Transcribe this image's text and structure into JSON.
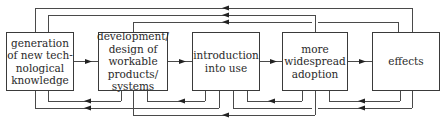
{
  "diagram": {
    "stages": [
      {
        "id": "generation",
        "label": "generation\nof new tech-\nnological\nknowledge",
        "x": 6,
        "y": 32,
        "w": 68,
        "h": 59
      },
      {
        "id": "development",
        "label": "development/\ndesign of\nworkable\nproducts/\nsystems",
        "x": 98,
        "y": 32,
        "w": 70,
        "h": 59
      },
      {
        "id": "introduction",
        "label": "introduction\ninto use",
        "x": 192,
        "y": 32,
        "w": 68,
        "h": 59
      },
      {
        "id": "adoption",
        "label": "more\nwidespread\nadoption",
        "x": 282,
        "y": 32,
        "w": 66,
        "h": 59
      },
      {
        "id": "effects",
        "label": "effects",
        "x": 372,
        "y": 32,
        "w": 68,
        "h": 59
      }
    ],
    "forward_arrows": [
      {
        "from": "generation",
        "to": "development"
      },
      {
        "from": "development",
        "to": "introduction"
      },
      {
        "from": "introduction",
        "to": "adoption"
      },
      {
        "from": "adoption",
        "to": "effects"
      }
    ],
    "feedback_top": [
      {
        "from": "effects",
        "to": "generation",
        "y": 8,
        "from_x": 412,
        "to_x": 35,
        "arrow_x": 226
      },
      {
        "from": "adoption",
        "to": "generation",
        "y": 15,
        "from_x": 315,
        "to_x": 48,
        "arrow_x": 226
      },
      {
        "from": "effects",
        "to": "development",
        "y": 22,
        "from_x": 398,
        "to_x": 133,
        "arrow_x": 226,
        "gap_x": 315
      }
    ],
    "feedback_bottom": [
      {
        "from": "development",
        "to": "generation",
        "y": 101,
        "from_x": 121,
        "to_x": 48,
        "arrow_x": 88
      },
      {
        "from": "introduction",
        "to": "generation",
        "y": 108,
        "from_x": 219,
        "to_x": 35,
        "arrow_x": 88
      },
      {
        "from": "introduction",
        "to": "development",
        "y": 101,
        "from_x": 205,
        "to_x": 147,
        "arrow_x": 182
      },
      {
        "from": "adoption",
        "to": "development",
        "y": 115,
        "from_x": 315,
        "to_x": 133,
        "arrow_x": 226
      },
      {
        "from": "adoption",
        "to": "introduction",
        "y": 101,
        "from_x": 302,
        "to_x": 247,
        "arrow_x": 272
      },
      {
        "from": "effects",
        "to": "introduction",
        "y": 108,
        "from_x": 412,
        "to_x": 233,
        "arrow_x": 362,
        "gap_x": 315
      },
      {
        "from": "effects",
        "to": "adoption",
        "y": 101,
        "from_x": 400,
        "to_x": 329,
        "arrow_x": 362
      }
    ],
    "colors": {
      "line": "#4a4a4a",
      "box_border": "#3a3a3a",
      "text": "#2a2a2a",
      "background": "#ffffff"
    }
  }
}
